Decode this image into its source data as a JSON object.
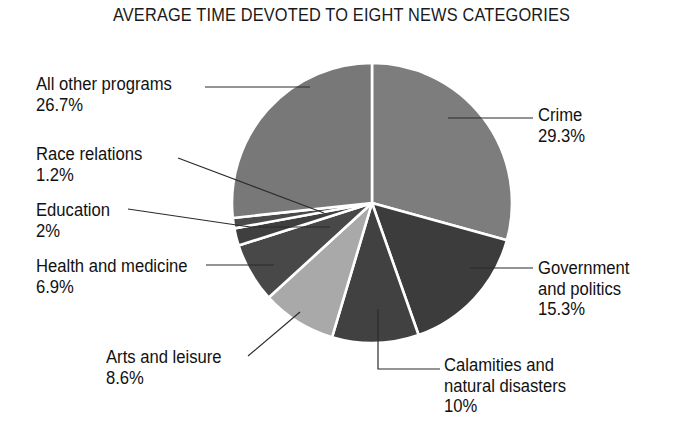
{
  "chart_data": {
    "type": "pie",
    "title": "AVERAGE TIME DEVOTED TO EIGHT NEWS CATEGORIES",
    "xlabel": "",
    "ylabel": "",
    "legend": "none",
    "grid": false,
    "units": "percent",
    "categories": [
      "Crime",
      "Government and politics",
      "Calamities and natural disasters",
      "Arts and leisure",
      "Health and medicine",
      "Education",
      "Race relations",
      "All other programs"
    ],
    "values": [
      29.3,
      15.3,
      10,
      8.6,
      6.9,
      2,
      1.2,
      26.7
    ],
    "slices": [
      {
        "label": "Crime",
        "value": 29.3,
        "value_text": "29.3%",
        "color": "#7d7d7d"
      },
      {
        "label": "Government and politics",
        "value": 15.3,
        "value_text": "15.3%",
        "color": "#3c3c3c"
      },
      {
        "label": "Calamities and natural disasters",
        "value": 10,
        "value_text": "10%",
        "color": "#414141"
      },
      {
        "label": "Arts and leisure",
        "value": 8.6,
        "value_text": "8.6%",
        "color": "#a9a9a9"
      },
      {
        "label": "Health and medicine",
        "value": 6.9,
        "value_text": "6.9%",
        "color": "#484848"
      },
      {
        "label": "Education",
        "value": 2,
        "value_text": "2%",
        "color": "#3f3f3f"
      },
      {
        "label": "Race relations",
        "value": 1.2,
        "value_text": "1.2%",
        "color": "#4a4a4a"
      },
      {
        "label": "All other programs",
        "value": 26.7,
        "value_text": "26.7%",
        "color": "#787878"
      }
    ],
    "start_angle_deg": 0,
    "direction": "clockwise",
    "divider_color": "#ffffff",
    "background": "#ffffff",
    "text_color": "#111111"
  },
  "callouts": {
    "all_other_programs": {
      "label": "All other programs",
      "value": "26.7%"
    },
    "race_relations": {
      "label": "Race relations",
      "value": "1.2%"
    },
    "education": {
      "label": "Education",
      "value": "2%"
    },
    "health_and_medicine": {
      "label": "Health and medicine",
      "value": "6.9%"
    },
    "arts_and_leisure": {
      "label": "Arts and leisure",
      "value": "8.6%"
    },
    "crime": {
      "label": "Crime",
      "value": "29.3%"
    },
    "government": {
      "label_line1": "Government",
      "label_line2": "and politics",
      "value": "15.3%"
    },
    "calamities": {
      "label_line1": "Calamities and",
      "label_line2": "natural disasters",
      "value": "10%"
    }
  }
}
